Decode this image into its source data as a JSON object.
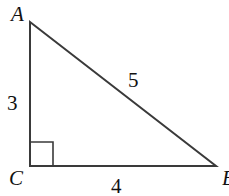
{
  "diagram": {
    "type": "right-triangle",
    "vertices": {
      "A": {
        "label": "A"
      },
      "B": {
        "label": "B"
      },
      "C": {
        "label": "C"
      }
    },
    "sides": {
      "AC": "3",
      "CB": "4",
      "AB": "5"
    },
    "right_angle_at": "C",
    "stroke_color": "#3a3a3a"
  }
}
